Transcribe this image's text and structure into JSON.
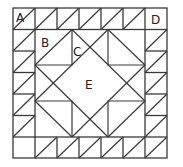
{
  "diagram": {
    "type": "quilt-block",
    "colors": {
      "line": "#3a3a3a",
      "background": "#ffffff",
      "label": "#222222"
    },
    "labels": {
      "A": "A",
      "B": "B",
      "C": "C",
      "D": "D",
      "E": "E"
    },
    "grid": {
      "columns": 7,
      "rows": 7
    }
  }
}
